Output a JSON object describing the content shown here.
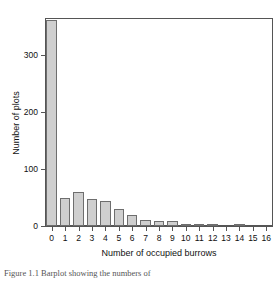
{
  "chart_data": {
    "type": "bar",
    "title": "",
    "subtitle": "",
    "xlabel": "Number of occupied burrows",
    "ylabel": "Number of plots",
    "categories": [
      "0",
      "1",
      "2",
      "3",
      "4",
      "5",
      "6",
      "7",
      "8",
      "9",
      "10",
      "11",
      "12",
      "13",
      "14",
      "15",
      "16"
    ],
    "values": [
      362,
      49,
      59,
      47,
      44,
      30,
      19,
      11,
      8,
      8,
      1,
      2,
      4,
      0,
      1,
      0,
      0
    ],
    "xlim": [
      -0.5,
      16.5
    ],
    "ylim": [
      0,
      365
    ],
    "ytick_values": [
      0,
      100,
      200,
      300
    ],
    "ytick_labels": [
      "0",
      "100",
      "200",
      "300"
    ],
    "xtick_labels": [
      "0",
      "1",
      "2",
      "3",
      "4",
      "5",
      "6",
      "7",
      "8",
      "9",
      "10",
      "11",
      "12",
      "13",
      "14",
      "15",
      "16"
    ],
    "grid": false,
    "legend": null,
    "bar_fill_color": "#cfcfcf",
    "bar_edge_color": "#6e6e6e",
    "axis_color": "#555555",
    "background_color": "#ffffff"
  },
  "figure": {
    "caption": "Figure 1.1  Barplot showing the numbers of",
    "caption_visible": true
  }
}
